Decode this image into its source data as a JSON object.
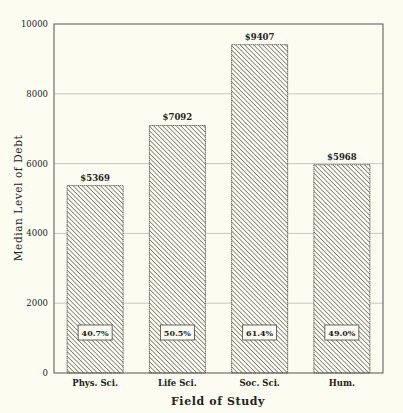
{
  "chart_data": {
    "type": "bar",
    "title": "",
    "xlabel": "Field of Study",
    "ylabel": "Median Level of Debt",
    "categories": [
      "Phys. Sci.",
      "Life Sci.",
      "Soc. Sci.",
      "Hum."
    ],
    "values": [
      5369,
      7092,
      9407,
      5968
    ],
    "value_labels": [
      "$5369",
      "$7092",
      "$9407",
      "$5968"
    ],
    "inner_labels": [
      "40.7%",
      "50.5%",
      "61.4%",
      "49.0%"
    ],
    "ylim": [
      0,
      10000
    ],
    "yticks": [
      0,
      2000,
      4000,
      6000,
      8000,
      10000
    ],
    "ytick_labels": [
      "0",
      "2000",
      "4000",
      "6000",
      "8000",
      "10000"
    ],
    "grid": true,
    "legend": null,
    "bar_fill": "diagonal-hatch",
    "colors": {
      "background": "#fcfcf0",
      "axis": "#555555",
      "grid": "#c8c8c0",
      "hatch": "#555555",
      "text": "#222222"
    }
  }
}
